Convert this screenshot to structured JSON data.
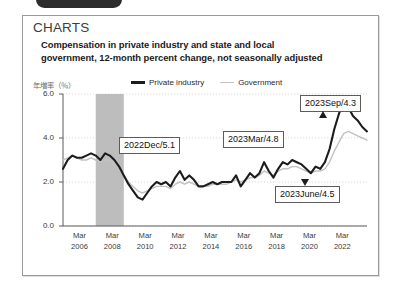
{
  "chrome": {
    "pill_text": "",
    "label_text": "",
    "right_text": ""
  },
  "card": {
    "section_heading": "CHARTS",
    "figure_title": "Compensation in private industry and state and local government, 12-month percent change, not seasonally adjusted"
  },
  "chart_data": {
    "type": "line",
    "title": "Compensation in private industry and state and local government, 12-month percent change, not seasonally adjusted",
    "xlabel": "",
    "ylabel": "年増率（％）",
    "ylim": [
      0.0,
      6.0
    ],
    "yticks": [
      "0.0",
      "2.0",
      "4.0",
      "6.0"
    ],
    "ytick_values": [
      0.0,
      2.0,
      4.0,
      6.0
    ],
    "grid": true,
    "legend_position": "top",
    "xticks": [
      {
        "month": "Mar",
        "year": "2006"
      },
      {
        "month": "Mar",
        "year": "2008"
      },
      {
        "month": "Mar",
        "year": "2010"
      },
      {
        "month": "Mar",
        "year": "2012"
      },
      {
        "month": "Mar",
        "year": "2014"
      },
      {
        "month": "Mar",
        "year": "2016"
      },
      {
        "month": "Mar",
        "year": "2018"
      },
      {
        "month": "Mar",
        "year": "2020"
      },
      {
        "month": "Mar",
        "year": "2022"
      }
    ],
    "series": [
      {
        "name": "Private industry",
        "color": "#1c1c1c",
        "values": [
          2.6,
          3.0,
          3.2,
          3.1,
          3.1,
          3.2,
          3.3,
          3.2,
          3.0,
          3.3,
          3.2,
          3.0,
          2.7,
          2.3,
          1.9,
          1.6,
          1.3,
          1.2,
          1.5,
          1.8,
          2.0,
          1.9,
          2.0,
          1.8,
          2.2,
          2.5,
          2.1,
          2.3,
          2.1,
          1.8,
          1.8,
          1.9,
          2.0,
          1.9,
          2.0,
          2.0,
          2.0,
          2.3,
          1.8,
          2.1,
          2.4,
          2.2,
          2.4,
          2.9,
          2.5,
          2.2,
          2.6,
          2.9,
          2.8,
          3.0,
          2.9,
          2.8,
          2.6,
          2.4,
          2.7,
          2.6,
          2.9,
          3.5,
          4.4,
          5.1,
          5.7,
          5.4,
          5.0,
          4.8,
          4.5,
          4.3
        ]
      },
      {
        "name": "Government",
        "color": "#c2c2c2",
        "values": [
          3.0,
          3.1,
          3.2,
          3.1,
          3.0,
          3.0,
          3.1,
          3.0,
          2.9,
          3.0,
          3.0,
          2.8,
          2.6,
          2.3,
          2.0,
          1.8,
          1.6,
          1.5,
          1.6,
          1.7,
          1.8,
          1.8,
          1.8,
          1.7,
          1.9,
          2.0,
          1.9,
          2.0,
          1.9,
          1.8,
          1.8,
          1.8,
          1.9,
          1.9,
          1.9,
          1.9,
          2.0,
          2.1,
          2.0,
          2.1,
          2.2,
          2.2,
          2.3,
          2.5,
          2.4,
          2.3,
          2.5,
          2.6,
          2.6,
          2.7,
          2.7,
          2.6,
          2.5,
          2.4,
          2.5,
          2.5,
          2.6,
          2.9,
          3.4,
          3.8,
          4.2,
          4.3,
          4.2,
          4.1,
          4.0,
          3.9
        ]
      }
    ],
    "shaded_regions": [
      {
        "label": "recession",
        "color": "#bdbdbd",
        "start_index": 7,
        "end_index": 13
      }
    ],
    "annotations": [
      {
        "name": "2022dec",
        "text": "2022Dec/5.1",
        "value": 5.1,
        "period": "2022Dec"
      },
      {
        "name": "2023mar",
        "text": "2023Mar/4.8",
        "value": 4.8,
        "period": "2023Mar"
      },
      {
        "name": "2023jun",
        "text": "2023June/4.5",
        "value": 4.5,
        "period": "2023June"
      },
      {
        "name": "2023sep",
        "text": "2023Sep/4.3",
        "value": 4.3,
        "period": "2023Sep"
      }
    ]
  },
  "legend": {
    "private_label": "Private industry",
    "government_label": "Government"
  }
}
